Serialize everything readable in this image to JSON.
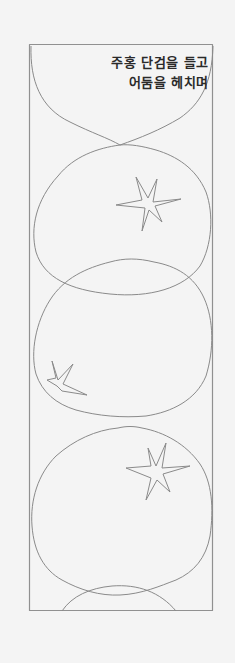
{
  "page": {
    "background": "#f4f4f4",
    "line_color": "#8a8a8a",
    "text_color": "#2a2a2a"
  },
  "caption": {
    "lines": [
      "주홍 단검을 들고",
      "어둠을 헤치며"
    ]
  },
  "illustration": {
    "frame": {
      "x": 29,
      "y": 44,
      "width": 184,
      "height": 567
    },
    "shapes": [
      {
        "type": "fruit-outline",
        "label": "top partial fruit"
      },
      {
        "type": "fruit-outline",
        "label": "second fruit",
        "has_star": true
      },
      {
        "type": "fruit-outline",
        "label": "third fruit",
        "has_star": true
      },
      {
        "type": "fruit-outline",
        "label": "fourth fruit",
        "has_star": true
      },
      {
        "type": "fruit-outline",
        "label": "bottom partial fruit"
      }
    ]
  }
}
